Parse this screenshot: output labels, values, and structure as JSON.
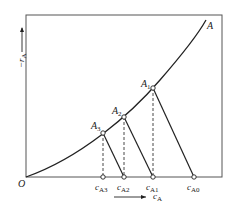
{
  "diagram": {
    "curve_label": "A",
    "origin_label": "O",
    "y_axis_label": "−r",
    "y_axis_sub": "A",
    "x_axis_label": "c",
    "x_axis_sub": "A",
    "points": [
      {
        "label": "A",
        "sub": "1"
      },
      {
        "label": "A",
        "sub": "2"
      },
      {
        "label": "A",
        "sub": "3"
      }
    ],
    "axis_ticks": [
      {
        "label": "c",
        "sub": "A3"
      },
      {
        "label": "c",
        "sub": "A2"
      },
      {
        "label": "c",
        "sub": "A1"
      },
      {
        "label": "c",
        "sub": "A0"
      }
    ],
    "colors": {
      "line": "#222222",
      "frame": "#444444"
    }
  }
}
